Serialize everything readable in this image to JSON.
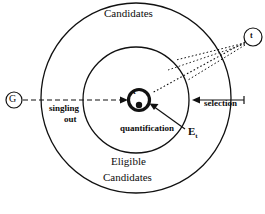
{
  "diagram": {
    "type": "venn-concentric-circles",
    "stroke_color": "#111111",
    "background_color": "#ffffff",
    "labels": {
      "outer_region": "Candidates",
      "inner_region_line1": "Eligible",
      "inner_region_line2": "Candidates",
      "arrow_left_line1": "singling",
      "arrow_left_line2": "out",
      "arrow_right": "selection",
      "arrow_center": "quantification",
      "inner_boundary_symbol": "E",
      "inner_boundary_subscript": "t",
      "center_node": "t",
      "source_node": "t",
      "origin_node": "G"
    },
    "geometry": {
      "outer_circle": {
        "cx": 136,
        "cy": 98,
        "r": 95
      },
      "inner_circle": {
        "cx": 136,
        "cy": 100,
        "r": 53
      },
      "center_node": {
        "cx": 139,
        "cy": 100,
        "r": 11
      },
      "source_node": {
        "cx": 253,
        "cy": 37,
        "r": 9
      },
      "origin_node": {
        "cx": 14,
        "cy": 100,
        "r": 8
      }
    }
  }
}
